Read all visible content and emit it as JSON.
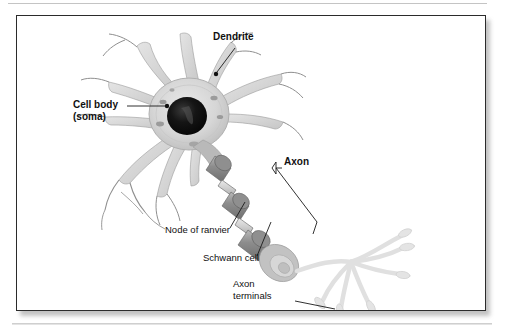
{
  "page": {
    "background_color": "#ffffff",
    "title_text": "",
    "top_rule": "divider",
    "bottom_rule": "divider"
  },
  "figure": {
    "name": "neuron-anatomy-diagram",
    "border_color": "#2b2b2b",
    "background_color": "#ffffff",
    "style": "grayscale textbook illustration of a single neuron",
    "colors": {
      "soma_fill": "#d9d9d9",
      "soma_edge": "#b4b4b4",
      "nucleus_fill": "#121212",
      "dendrite_fill": "#d5d5d5",
      "dendrite_stroke": "#8c8c8c",
      "myelin_dark": "#8a8a8a",
      "myelin_mid": "#a8a8a8",
      "node_light": "#d8d8d8",
      "terminal_fill": "#e2e2e2",
      "leader_line": "#1a1a1a",
      "text": "#111111"
    },
    "labels": [
      {
        "id": "dendrite",
        "text": "Dendrite",
        "weight": "bold",
        "lines": [
          "Dendrite"
        ],
        "points_to": "dendrite branch above the cell body"
      },
      {
        "id": "cell-body",
        "text": "Cell body (soma)",
        "weight": "bold",
        "lines": [
          "Cell body",
          "(soma)"
        ],
        "points_to": "cell body / soma"
      },
      {
        "id": "axon",
        "text": "Axon",
        "weight": "bold",
        "lines": [
          "Axon"
        ],
        "points_to": "myelinated axon"
      },
      {
        "id": "node-of-ranvier",
        "text": "Node of ranvier",
        "weight": "regular",
        "lines": [
          "Node of ranvier"
        ],
        "points_to": "constriction between myelin segments"
      },
      {
        "id": "schwann-cell",
        "text": "Schwann cell",
        "weight": "regular",
        "lines": [
          "Schwann cell"
        ],
        "points_to": "myelin sheath segment"
      },
      {
        "id": "axon-terminals",
        "text": "Axon terminals",
        "weight": "regular",
        "lines": [
          "Axon",
          "terminals"
        ],
        "points_to": "terminal bouton at end of axon branch"
      }
    ]
  }
}
